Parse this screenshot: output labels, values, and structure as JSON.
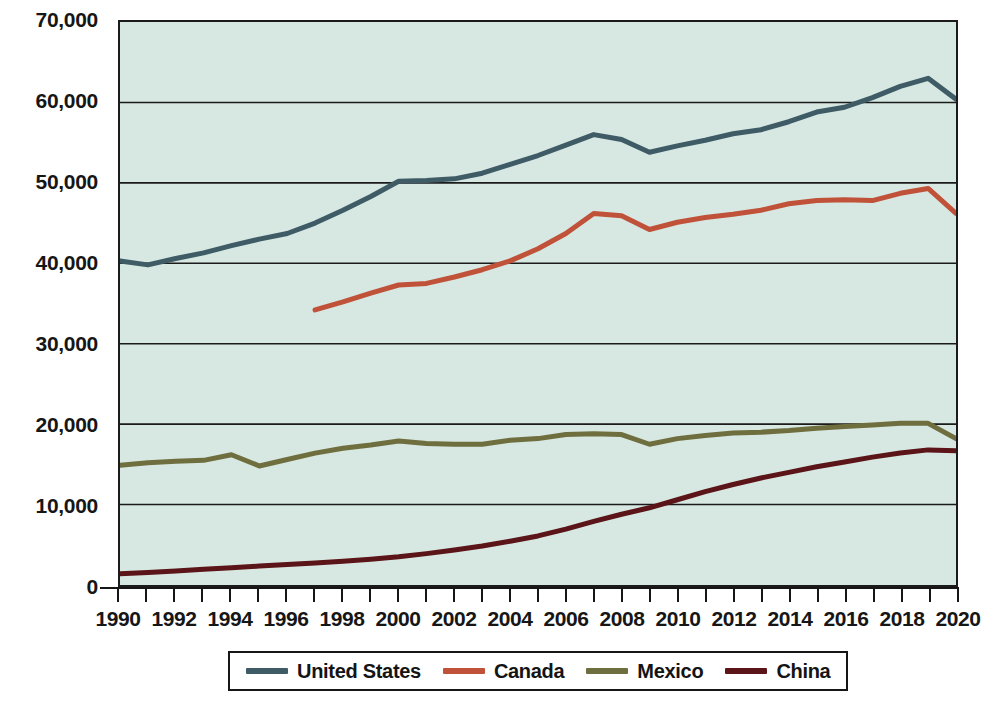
{
  "chart_data": {
    "type": "line",
    "title": "",
    "subtitle": "",
    "xlabel": "",
    "ylabel": "",
    "xlim": [
      1990,
      2020
    ],
    "ylim": [
      0,
      70000
    ],
    "grid": "horizontal",
    "legend_position": "bottom",
    "background_color": "#d7e8e2",
    "x": [
      1990,
      1991,
      1992,
      1993,
      1994,
      1995,
      1996,
      1997,
      1998,
      1999,
      2000,
      2001,
      2002,
      2003,
      2004,
      2005,
      2006,
      2007,
      2008,
      2009,
      2010,
      2011,
      2012,
      2013,
      2014,
      2015,
      2016,
      2017,
      2018,
      2019,
      2020
    ],
    "y_tick_labels": [
      "0",
      "10,000",
      "20,000",
      "30,000",
      "40,000",
      "50,000",
      "60,000",
      "70,000"
    ],
    "y_tick_values": [
      0,
      10000,
      20000,
      30000,
      40000,
      50000,
      60000,
      70000
    ],
    "x_tick_labels": [
      "1990",
      "1992",
      "1994",
      "1996",
      "1998",
      "2000",
      "2002",
      "2004",
      "2006",
      "2008",
      "2010",
      "2012",
      "2014",
      "2016",
      "2018",
      "2020"
    ],
    "x_tick_values": [
      1990,
      1992,
      1994,
      1996,
      1998,
      2000,
      2002,
      2004,
      2006,
      2008,
      2010,
      2012,
      2014,
      2016,
      2018,
      2020
    ],
    "x_minor_ticks": [
      1990,
      1991,
      1992,
      1993,
      1994,
      1995,
      1996,
      1997,
      1998,
      1999,
      2000,
      2001,
      2002,
      2003,
      2004,
      2005,
      2006,
      2007,
      2008,
      2009,
      2010,
      2011,
      2012,
      2013,
      2014,
      2015,
      2016,
      2017,
      2018,
      2019,
      2020
    ],
    "series": [
      {
        "name": "United States",
        "color": "#3f5b66",
        "x": [
          1990,
          1991,
          1992,
          1993,
          1994,
          1995,
          1996,
          1997,
          1998,
          1999,
          2000,
          2001,
          2002,
          2003,
          2004,
          2005,
          2006,
          2007,
          2008,
          2009,
          2010,
          2011,
          2012,
          2013,
          2014,
          2015,
          2016,
          2017,
          2018,
          2019,
          2020
        ],
        "values": [
          40300,
          39800,
          40600,
          41300,
          42200,
          43000,
          43700,
          45000,
          46600,
          48300,
          50200,
          50300,
          50500,
          51200,
          52300,
          53400,
          54700,
          56000,
          55400,
          53800,
          54600,
          55300,
          56100,
          56600,
          57600,
          58800,
          59400,
          60600,
          62000,
          63000,
          60400
        ]
      },
      {
        "name": "Canada",
        "color": "#c0523a",
        "x": [
          1997,
          1998,
          1999,
          2000,
          2001,
          2002,
          2003,
          2004,
          2005,
          2006,
          2007,
          2008,
          2009,
          2010,
          2011,
          2012,
          2013,
          2014,
          2015,
          2016,
          2017,
          2018,
          2019,
          2020
        ],
        "values": [
          34200,
          35200,
          36300,
          37300,
          37500,
          38300,
          39200,
          40300,
          41800,
          43700,
          46200,
          45900,
          44200,
          45100,
          45700,
          46100,
          46600,
          47400,
          47800,
          47900,
          47800,
          48700,
          49300,
          46200
        ]
      },
      {
        "name": "Mexico",
        "color": "#6f6e3e",
        "x": [
          1990,
          1991,
          1992,
          1993,
          1994,
          1995,
          1996,
          1997,
          1998,
          1999,
          2000,
          2001,
          2002,
          2003,
          2004,
          2005,
          2006,
          2007,
          2008,
          2009,
          2010,
          2011,
          2012,
          2013,
          2014,
          2015,
          2016,
          2017,
          2018,
          2019,
          2020
        ],
        "values": [
          14900,
          15200,
          15400,
          15500,
          16200,
          14800,
          15600,
          16400,
          17000,
          17400,
          17900,
          17600,
          17500,
          17500,
          18000,
          18200,
          18700,
          18800,
          18700,
          17500,
          18200,
          18600,
          18900,
          19000,
          19200,
          19500,
          19700,
          19900,
          20100,
          20100,
          18200
        ]
      },
      {
        "name": "China",
        "color": "#5b1417",
        "x": [
          1990,
          1991,
          1992,
          1993,
          1994,
          1995,
          1996,
          1997,
          1998,
          1999,
          2000,
          2001,
          2002,
          2003,
          2004,
          2005,
          2006,
          2007,
          2008,
          2009,
          2010,
          2011,
          2012,
          2013,
          2014,
          2015,
          2016,
          2017,
          2018,
          2019,
          2020
        ],
        "values": [
          1400,
          1550,
          1750,
          1950,
          2150,
          2350,
          2550,
          2750,
          2950,
          3200,
          3500,
          3900,
          4350,
          4850,
          5450,
          6100,
          6950,
          7900,
          8800,
          9600,
          10600,
          11600,
          12500,
          13300,
          14000,
          14700,
          15300,
          15900,
          16400,
          16800,
          16700
        ]
      }
    ]
  },
  "legend": {
    "entries": [
      {
        "label": "United States",
        "color": "#3f5b66"
      },
      {
        "label": "Canada",
        "color": "#c0523a"
      },
      {
        "label": "Mexico",
        "color": "#6f6e3e"
      },
      {
        "label": "China",
        "color": "#5b1417"
      }
    ]
  }
}
